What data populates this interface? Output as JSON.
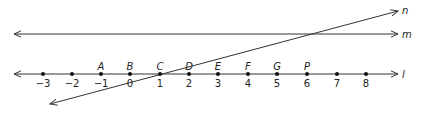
{
  "diagram": {
    "lines": [
      {
        "name": "n",
        "label": "n"
      },
      {
        "name": "m",
        "label": "m"
      },
      {
        "name": "l",
        "label": "l"
      }
    ],
    "number_line": {
      "ticks": [
        {
          "value": "−3",
          "x": 43,
          "point": ""
        },
        {
          "value": "−2",
          "x": 72,
          "point": ""
        },
        {
          "value": "−1",
          "x": 101,
          "point": "A"
        },
        {
          "value": "0",
          "x": 130,
          "point": "B"
        },
        {
          "value": "1",
          "x": 160,
          "point": "C"
        },
        {
          "value": "2",
          "x": 189,
          "point": "D"
        },
        {
          "value": "3",
          "x": 218,
          "point": "E"
        },
        {
          "value": "4",
          "x": 248,
          "point": "F"
        },
        {
          "value": "5",
          "x": 277,
          "point": "G"
        },
        {
          "value": "6",
          "x": 307,
          "point": "P"
        },
        {
          "value": "7",
          "x": 337,
          "point": ""
        },
        {
          "value": "8",
          "x": 366,
          "point": ""
        }
      ]
    },
    "colors": {
      "stroke": "#333333",
      "dot": "#111111"
    }
  }
}
